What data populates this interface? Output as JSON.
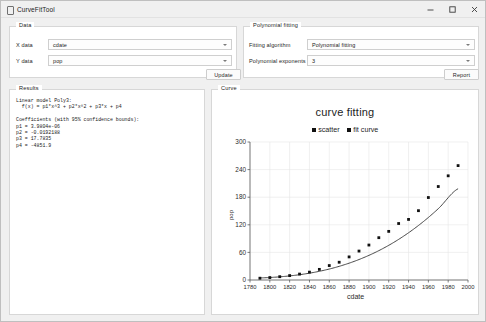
{
  "window": {
    "title": "CurveFitTool",
    "icon": "app-icon",
    "controls": [
      {
        "name": "minimize-button",
        "glyph": "minimize-icon"
      },
      {
        "name": "maximize-button",
        "glyph": "maximize-icon"
      },
      {
        "name": "close-button",
        "glyph": "close-icon"
      }
    ]
  },
  "data_panel": {
    "title": "Data",
    "x_data": {
      "label": "X data",
      "value": "cdate"
    },
    "y_data": {
      "label": "Y data",
      "value": "pop"
    },
    "update_button": "Update"
  },
  "fitting_panel": {
    "title": "Polynomial fitting",
    "algorithm": {
      "label": "Fitting algorithm",
      "value": "Polynomial fitting"
    },
    "exponents": {
      "label": "Polynomial exponents",
      "value": "3"
    },
    "report_button": "Report"
  },
  "results_panel": {
    "title": "Results",
    "text": "Linear model Poly3:\n  f(x) = p1*x^3 + p2*x^2 + p3*x + p4\n\nCoefficients (with 95% confidence bounds):\np1 = 3.9804e-06\np2 = -0.0192188\np3 = 17.7835\np4 = -4851.9"
  },
  "curve_panel": {
    "title": "Curve"
  },
  "chart_data": {
    "type": "scatter",
    "title": "curve fitting",
    "xlabel": "cdate",
    "ylabel": "pop",
    "xlim": [
      1780,
      2000
    ],
    "ylim": [
      0,
      300
    ],
    "xticks": [
      1780,
      1800,
      1820,
      1840,
      1860,
      1880,
      1900,
      1920,
      1940,
      1960,
      1980,
      2000
    ],
    "yticks": [
      0,
      60,
      120,
      180,
      240,
      300
    ],
    "grid": true,
    "legend_position": "top-center",
    "legend": [
      "scatter",
      "fit curve"
    ],
    "series": [
      {
        "name": "scatter",
        "type": "scatter",
        "color": "#111111",
        "x": [
          1790,
          1800,
          1810,
          1820,
          1830,
          1840,
          1850,
          1860,
          1870,
          1880,
          1890,
          1900,
          1910,
          1920,
          1930,
          1940,
          1950,
          1960,
          1970,
          1980,
          1990
        ],
        "y": [
          3.9,
          5.3,
          7.2,
          9.6,
          12.9,
          17.1,
          23.1,
          31.4,
          38.6,
          50.2,
          62.9,
          76.0,
          92.0,
          105.7,
          122.8,
          131.7,
          150.7,
          179.3,
          203.2,
          226.5,
          248.7
        ]
      },
      {
        "name": "fit curve",
        "type": "line",
        "color": "#333333",
        "x": [
          1790,
          1810,
          1830,
          1850,
          1870,
          1890,
          1910,
          1930,
          1950,
          1970,
          1990
        ],
        "y": [
          4.5,
          6.9,
          11.5,
          18.9,
          29.7,
          44.5,
          63.8,
          88.3,
          118.5,
          155.0,
          198.4
        ]
      }
    ]
  }
}
